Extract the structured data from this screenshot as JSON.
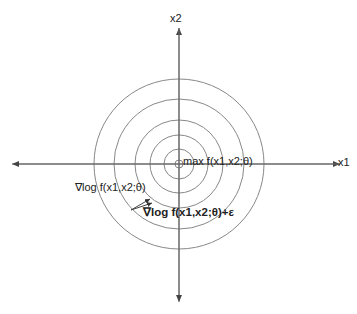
{
  "diagram": {
    "center": {
      "x": 179,
      "y": 164
    },
    "contour_radii": [
      85,
      65,
      44,
      29,
      15,
      4
    ],
    "axes": {
      "x_label": "x1",
      "y_label": "x2"
    },
    "labels": {
      "maximum": "max f(x1,x2;θ)",
      "gradient": "∇log f(x1,x2;θ)",
      "noisy_gradient": "∇log f(x1,x2;θ)+ε"
    },
    "colors": {
      "line": "#777777",
      "axis": "#555555",
      "text": "#222222"
    }
  }
}
